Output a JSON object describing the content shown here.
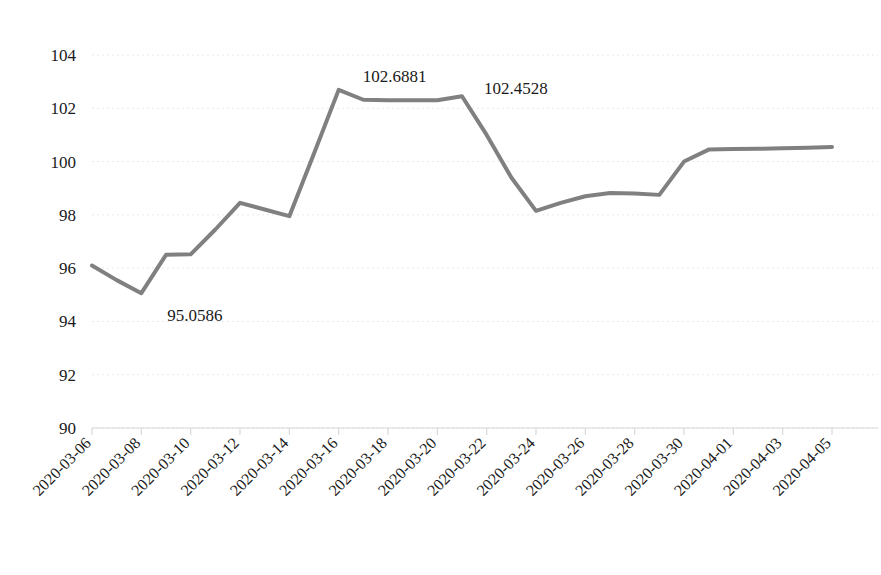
{
  "chart_data": {
    "type": "line",
    "title": "",
    "subtitle": "",
    "xlabel": "",
    "ylabel": "",
    "grid": true,
    "legend": false,
    "legend_position": "none",
    "line_color": "#808080",
    "line_width": 4,
    "text_color": "#1a1a1a",
    "gridline_color": "#e8e8ec",
    "axis_color": "#d8d8dc",
    "background": "#ffffff",
    "ylim": [
      90,
      104
    ],
    "y_ticks": [
      90,
      92,
      94,
      96,
      98,
      100,
      102,
      104
    ],
    "y_tick_labels": [
      "90",
      "92",
      "94",
      "96",
      "98",
      "100",
      "102",
      "104"
    ],
    "x_tick_labels": [
      "2020-03-06",
      "2020-03-08",
      "2020-03-10",
      "2020-03-12",
      "2020-03-14",
      "2020-03-16",
      "2020-03-18",
      "2020-03-20",
      "2020-03-22",
      "2020-03-24",
      "2020-03-26",
      "2020-03-28",
      "2020-03-30",
      "2020-04-01",
      "2020-04-03",
      "2020-04-05"
    ],
    "x_tick_label_rotation": -45,
    "x_tick_every_n_points": 2,
    "x": [
      "2020-03-06",
      "2020-03-07",
      "2020-03-08",
      "2020-03-09",
      "2020-03-10",
      "2020-03-11",
      "2020-03-12",
      "2020-03-13",
      "2020-03-14",
      "2020-03-15",
      "2020-03-16",
      "2020-03-17",
      "2020-03-18",
      "2020-03-19",
      "2020-03-20",
      "2020-03-21",
      "2020-03-22",
      "2020-03-23",
      "2020-03-24",
      "2020-03-25",
      "2020-03-26",
      "2020-03-27",
      "2020-03-28",
      "2020-03-29",
      "2020-03-30",
      "2020-03-31",
      "2020-04-01",
      "2020-04-02",
      "2020-04-03",
      "2020-04-04",
      "2020-04-05"
    ],
    "values": [
      96.1,
      95.55,
      95.06,
      96.5,
      96.52,
      97.45,
      98.45,
      98.2,
      97.95,
      100.3,
      102.69,
      102.32,
      102.3,
      102.3,
      102.3,
      102.45,
      101.0,
      99.4,
      98.15,
      98.45,
      98.7,
      98.82,
      98.8,
      98.75,
      100.0,
      100.45,
      100.47,
      100.48,
      100.5,
      100.52,
      100.55
    ],
    "annotations": [
      {
        "label": "95.0586",
        "x_index": 2,
        "value": 95.0586,
        "dx": 26,
        "dy": 28
      },
      {
        "label": "102.6881",
        "x_index": 10,
        "value": 102.6881,
        "dx": 24,
        "dy": -8
      },
      {
        "label": "102.4528",
        "x_index": 15,
        "value": 102.4528,
        "dx": 22,
        "dy": -2
      }
    ]
  }
}
